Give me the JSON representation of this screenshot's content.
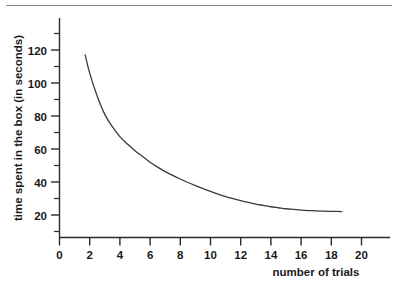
{
  "figure": {
    "background_color": "#ffffff",
    "axis_color": "#2b2b2b",
    "curve_color": "#3a3a3a",
    "rule_color": "#8a8a8a"
  },
  "chart_data": {
    "type": "line",
    "title": "",
    "subtitle": "",
    "xlabel": "number of trials",
    "ylabel": "time spent in the box (in seconds)",
    "xlim": [
      0,
      22
    ],
    "ylim": [
      0,
      128
    ],
    "grid": false,
    "legend": false,
    "legend_position": "none",
    "x_ticks": [
      0,
      2,
      4,
      6,
      8,
      10,
      12,
      14,
      16,
      18,
      20
    ],
    "x_tick_labels": [
      "0",
      "2",
      "4",
      "6",
      "8",
      "10",
      "12",
      "14",
      "16",
      "18",
      "20"
    ],
    "x_minor_ticks": [],
    "y_ticks": [
      20,
      40,
      60,
      80,
      100,
      120
    ],
    "y_tick_labels": [
      "20",
      "40",
      "60",
      "80",
      "100",
      "120"
    ],
    "y_minor_ticks": [
      10,
      30,
      50,
      70,
      90,
      110
    ],
    "series": [
      {
        "name": "time spent in the box",
        "x": [
          1.7,
          2.0,
          2.5,
          3.0,
          3.5,
          4.0,
          4.5,
          5.0,
          5.5,
          6.0,
          6.5,
          7.0,
          7.5,
          8.0,
          8.5,
          9.0,
          9.5,
          10.0,
          10.5,
          11.0,
          11.5,
          12.0,
          12.5,
          13.0,
          13.5,
          14.0,
          14.5,
          15.0,
          15.5,
          16.0,
          16.5,
          17.0,
          17.5,
          18.0,
          18.7
        ],
        "y": [
          117.0,
          106.0,
          92.0,
          81.0,
          73.5,
          67.5,
          63.0,
          59.0,
          55.5,
          52.0,
          49.0,
          46.3,
          44.0,
          41.8,
          39.7,
          37.8,
          36.0,
          34.3,
          32.7,
          31.2,
          29.9,
          28.7,
          27.6,
          26.6,
          25.8,
          25.0,
          24.4,
          23.8,
          23.4,
          23.0,
          22.7,
          22.5,
          22.3,
          22.2,
          22.1
        ]
      }
    ],
    "annotations": []
  }
}
